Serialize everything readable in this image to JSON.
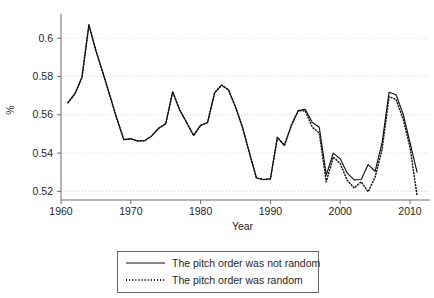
{
  "chart_data": {
    "type": "line",
    "title": "",
    "xlabel": "Year",
    "ylabel": "%",
    "xlim": [
      1960,
      2012
    ],
    "ylim": [
      0.515,
      0.609
    ],
    "grid": true,
    "xticks": [
      1960,
      1970,
      1980,
      1990,
      2000,
      2010
    ],
    "xticklabels": [
      "1960",
      "1970",
      "1980",
      "1990",
      "2000",
      "2010"
    ],
    "yticks": [
      0.52,
      0.54,
      0.56,
      0.58,
      0.6
    ],
    "yticklabels": [
      "0.52",
      "0.54",
      "0.56",
      "0.58",
      "0.6"
    ],
    "legend_position": "below-axes",
    "series": [
      {
        "name": "The pitch order was not random",
        "style": "solid",
        "color": "#111111",
        "x": [
          1961,
          1962,
          1963,
          1964,
          1965,
          1966,
          1967,
          1968,
          1969,
          1970,
          1971,
          1972,
          1973,
          1974,
          1975,
          1976,
          1977,
          1978,
          1979,
          1980,
          1981,
          1982,
          1983,
          1984,
          1985,
          1986,
          1987,
          1988,
          1989,
          1990,
          1991,
          1992,
          1993,
          1994,
          1995,
          1996,
          1997,
          1998,
          1999,
          2000,
          2001,
          2002,
          2003,
          2004,
          2005,
          2006,
          2007,
          2008,
          2009,
          2010,
          2011
        ],
        "y": [
          0.5663,
          0.571,
          0.5795,
          0.607,
          0.5935,
          0.582,
          0.57,
          0.558,
          0.547,
          0.5475,
          0.5463,
          0.5465,
          0.549,
          0.553,
          0.5553,
          0.572,
          0.5625,
          0.556,
          0.5492,
          0.5545,
          0.556,
          0.5715,
          0.5755,
          0.573,
          0.564,
          0.5535,
          0.54,
          0.527,
          0.5262,
          0.5265,
          0.5482,
          0.544,
          0.5545,
          0.5622,
          0.5628,
          0.556,
          0.5535,
          0.5285,
          0.54,
          0.537,
          0.5295,
          0.526,
          0.5262,
          0.534,
          0.5305,
          0.5455,
          0.5718,
          0.5705,
          0.5605,
          0.5455,
          0.53
        ]
      },
      {
        "name": "The pitch order was random",
        "style": "dotted",
        "color": "#111111",
        "x": [
          1961,
          1962,
          1963,
          1964,
          1965,
          1966,
          1967,
          1968,
          1969,
          1970,
          1971,
          1972,
          1973,
          1974,
          1975,
          1976,
          1977,
          1978,
          1979,
          1980,
          1981,
          1982,
          1983,
          1984,
          1985,
          1986,
          1987,
          1988,
          1989,
          1990,
          1991,
          1992,
          1993,
          1994,
          1995,
          1996,
          1997,
          1998,
          1999,
          2000,
          2001,
          2002,
          2003,
          2004,
          2005,
          2006,
          2007,
          2008,
          2009,
          2010,
          2011
        ],
        "y": [
          0.5663,
          0.571,
          0.5795,
          0.607,
          0.5935,
          0.582,
          0.57,
          0.558,
          0.547,
          0.5475,
          0.5463,
          0.5465,
          0.549,
          0.553,
          0.5553,
          0.572,
          0.5625,
          0.556,
          0.5492,
          0.5545,
          0.556,
          0.5715,
          0.5755,
          0.573,
          0.564,
          0.5535,
          0.54,
          0.527,
          0.5262,
          0.5265,
          0.5482,
          0.544,
          0.5545,
          0.5622,
          0.562,
          0.5535,
          0.5505,
          0.525,
          0.538,
          0.5345,
          0.5258,
          0.5218,
          0.525,
          0.5198,
          0.5275,
          0.542,
          0.5695,
          0.568,
          0.558,
          0.543,
          0.518
        ]
      }
    ]
  },
  "legend": {
    "entries": [
      {
        "label": "The pitch order was not random",
        "style": "solid"
      },
      {
        "label": "The pitch order was random",
        "style": "dotted"
      }
    ]
  }
}
